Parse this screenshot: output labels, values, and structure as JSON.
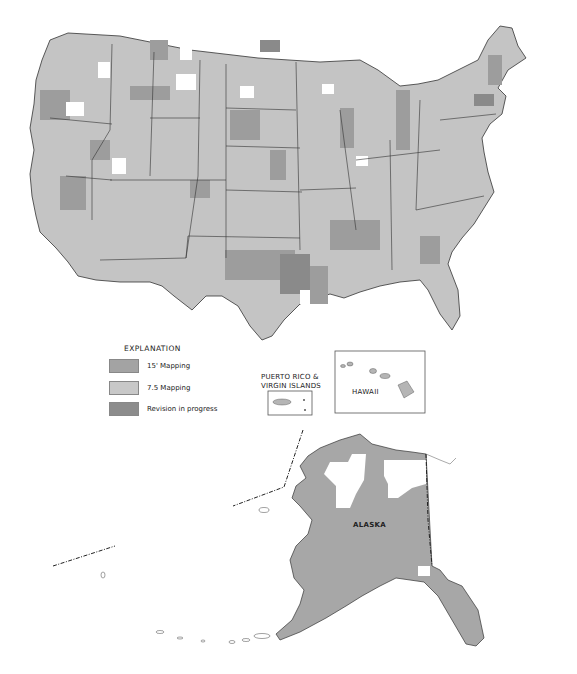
{
  "map": {
    "title": "Topographic mapping status of the United States",
    "regions": {
      "conterminous_us": {
        "label": ""
      },
      "alaska": {
        "label": "ALASKA"
      },
      "hawaii": {
        "label": "HAWAII"
      },
      "puerto_rico": {
        "label_line1": "PUERTO RICO &",
        "label_line2": "VIRGIN ISLANDS"
      }
    },
    "colors": {
      "mapping_15": "#9d9d9d",
      "mapping_7_5": "#c4c4c4",
      "revision": "#8a8a8a",
      "unmapped": "#ffffff",
      "border": "#333333"
    }
  },
  "legend": {
    "title": "EXPLANATION",
    "items": [
      {
        "label": "15' Mapping",
        "color": "#a3a3a3"
      },
      {
        "label": "7.5 Mapping",
        "color": "#c8c8c8"
      },
      {
        "label": "Revision in progress",
        "color": "#8c8c8c"
      }
    ]
  }
}
